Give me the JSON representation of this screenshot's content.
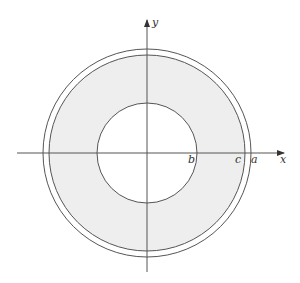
{
  "diagram": {
    "type": "annulus-with-axes",
    "center": {
      "x": 147,
      "y": 153
    },
    "circles": {
      "outer_a": {
        "r": 104,
        "stroke": "#555555"
      },
      "middle_c": {
        "r": 98,
        "stroke": "#555555",
        "fill": "#eeeeee"
      },
      "inner_b": {
        "r": 50,
        "stroke": "#555555",
        "fill": "#ffffff"
      }
    },
    "axes": {
      "x_label": "x",
      "y_label": "y",
      "color": "#555555"
    },
    "point_labels": {
      "b": "b",
      "c": "c",
      "a": "a"
    },
    "shading_color": "#eeeeee"
  }
}
